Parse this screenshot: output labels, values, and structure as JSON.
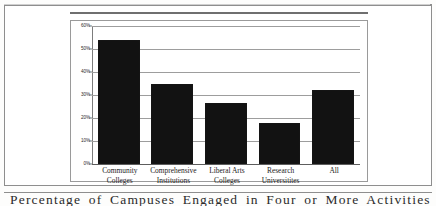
{
  "figure": {
    "caption_partial": "Percentage of Campuses Engaged in Four or More Activities"
  },
  "chart_data": {
    "type": "bar",
    "title": "",
    "xlabel": "",
    "ylabel": "",
    "categories": [
      "Community Colleges",
      "Comprehensive Institutions",
      "Liberal Arts Colleges",
      "Research Universitites",
      "All"
    ],
    "category_lines": [
      [
        "Community",
        "Colleges"
      ],
      [
        "Comprehensive",
        "Institutions"
      ],
      [
        "Liberal Arts",
        "Colleges"
      ],
      [
        "Research",
        "Universitites"
      ],
      [
        "All",
        ""
      ]
    ],
    "values": [
      54,
      35,
      26.5,
      18,
      32
    ],
    "ylim": [
      0,
      60
    ],
    "ytick_values": [
      0,
      10,
      20,
      30,
      40,
      50,
      60
    ],
    "ytick_labels": [
      "0%",
      "10%",
      "20%",
      "30%",
      "40%",
      "50%",
      "60%"
    ],
    "grid": true,
    "legend": false,
    "bar_color": "#121212",
    "gridline_color": "#9d9d9d",
    "axis_color": "#7c7c7c"
  }
}
